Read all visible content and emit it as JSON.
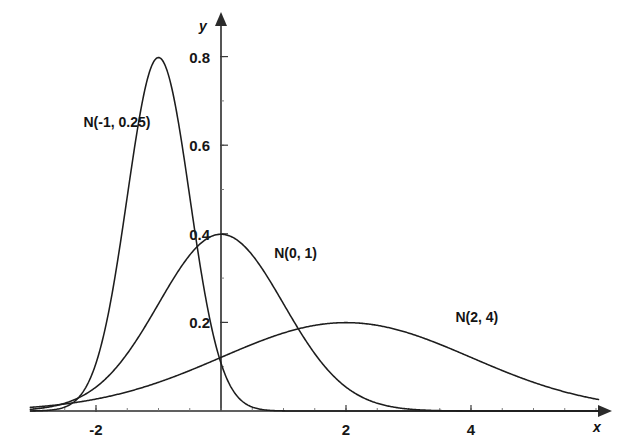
{
  "chart_data": {
    "type": "line",
    "title": "",
    "subtitle": "",
    "xlabel": "x",
    "ylabel": "y",
    "xlim": [
      -3.05,
      6.05
    ],
    "ylim": [
      0,
      0.88
    ],
    "grid": false,
    "legend_position": "inline-annotations",
    "x_ticks": [
      {
        "value": -2,
        "label": "-2"
      },
      {
        "value": 2,
        "label": "2"
      },
      {
        "value": 4,
        "label": "4"
      }
    ],
    "y_ticks": [
      {
        "value": 0.2,
        "label": "0.2"
      },
      {
        "value": 0.4,
        "label": "0.4"
      },
      {
        "value": 0.6,
        "label": "0.6"
      },
      {
        "value": 0.8,
        "label": "0.8"
      }
    ],
    "x_minor_tick_step": 0.5,
    "y_minor_tick_step": 0.1,
    "series": [
      {
        "name": "N(-1, 0.25)",
        "distribution": "normal",
        "mean": -1,
        "variance": 0.25,
        "std_dev": 0.5,
        "peak_x": -1,
        "peak_y": 0.798,
        "annotation": {
          "text": "N(-1, 0.25)",
          "x": -2.2,
          "y": 0.64
        }
      },
      {
        "name": "N(0, 1)",
        "distribution": "normal",
        "mean": 0,
        "variance": 1,
        "std_dev": 1,
        "peak_x": 0,
        "peak_y": 0.399,
        "annotation": {
          "text": "N(0, 1)",
          "x": 0.85,
          "y": 0.345
        }
      },
      {
        "name": "N(2, 4)",
        "distribution": "normal",
        "mean": 2,
        "variance": 4,
        "std_dev": 2,
        "peak_x": 2,
        "peak_y": 0.199,
        "annotation": {
          "text": "N(2, 4)",
          "x": 3.75,
          "y": 0.2
        }
      }
    ]
  },
  "axes": {
    "y_axis_label": "y",
    "x_axis_label": "x"
  }
}
